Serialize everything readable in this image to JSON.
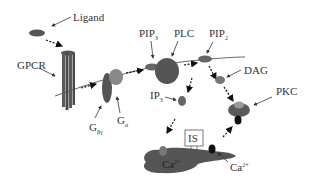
{
  "labels": {
    "ligand": "Ligand",
    "gpcr": "GPCR",
    "pip3": "PIP",
    "pip3_sub": "3",
    "plc": "PLC",
    "pip2": "PIP",
    "pip2_sub": "2",
    "dag": "DAG",
    "ip3": "IP",
    "ip3_sub": "3",
    "pkc": "PKC",
    "g_beta_gamma": "G",
    "g_beta_gamma_sub": "βγ",
    "g_alpha": "G",
    "g_alpha_sub": "α",
    "is": "IS",
    "ca_er": "Ca",
    "ca_er_sup": "2+",
    "ca_ion": "Ca",
    "ca_ion_sup": "2+"
  },
  "colors": {
    "dark": "#4a4a4a",
    "medium": "#707070",
    "light": "#9a9a9a",
    "black": "#111111",
    "line": "#555555"
  }
}
